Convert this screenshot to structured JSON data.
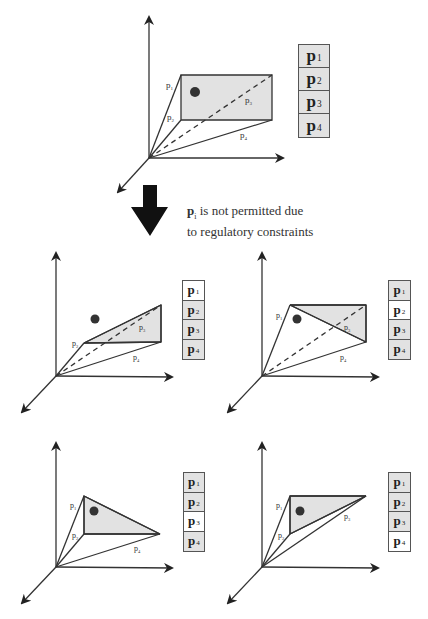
{
  "caption": {
    "symbol": "p",
    "subscript": "i",
    "line1_rest": " is not permitted due",
    "line2": "to regulatory constraints"
  },
  "colors": {
    "shade": "#e2e2e2",
    "line": "#333333",
    "dot": "#333333",
    "disabled": "#ffffff"
  },
  "panels": [
    {
      "id": "original",
      "labels": [
        "p1",
        "p2",
        "p3",
        "p4"
      ],
      "box": [
        {
          "label": "p",
          "sub": "1",
          "on": true
        },
        {
          "label": "p",
          "sub": "2",
          "on": true
        },
        {
          "label": "p",
          "sub": "3",
          "on": true
        },
        {
          "label": "p",
          "sub": "4",
          "on": true
        }
      ]
    },
    {
      "id": "without-p1",
      "box": [
        {
          "label": "p",
          "sub": "1",
          "on": false
        },
        {
          "label": "p",
          "sub": "2",
          "on": true
        },
        {
          "label": "p",
          "sub": "3",
          "on": true
        },
        {
          "label": "p",
          "sub": "4",
          "on": true
        }
      ]
    },
    {
      "id": "without-p2",
      "box": [
        {
          "label": "p",
          "sub": "1",
          "on": true
        },
        {
          "label": "p",
          "sub": "2",
          "on": false
        },
        {
          "label": "p",
          "sub": "3",
          "on": true
        },
        {
          "label": "p",
          "sub": "4",
          "on": true
        }
      ]
    },
    {
      "id": "without-p3",
      "box": [
        {
          "label": "p",
          "sub": "1",
          "on": true
        },
        {
          "label": "p",
          "sub": "2",
          "on": true
        },
        {
          "label": "p",
          "sub": "3",
          "on": false
        },
        {
          "label": "p",
          "sub": "4",
          "on": true
        }
      ]
    },
    {
      "id": "without-p4",
      "box": [
        {
          "label": "p",
          "sub": "1",
          "on": true
        },
        {
          "label": "p",
          "sub": "2",
          "on": true
        },
        {
          "label": "p",
          "sub": "3",
          "on": true
        },
        {
          "label": "p",
          "sub": "4",
          "on": false
        }
      ]
    }
  ],
  "edge_labels": {
    "p1": "p1",
    "p2": "p2",
    "p3": "p3",
    "p4": "p4"
  }
}
